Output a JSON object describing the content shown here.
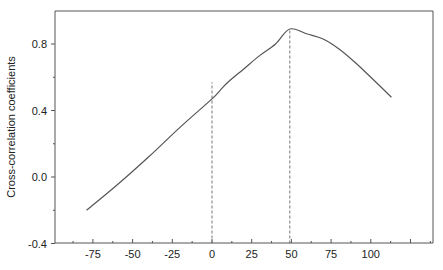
{
  "chart_data": {
    "type": "line",
    "title": "",
    "xlabel": "",
    "ylabel": "Cross-correlation coefficients",
    "xlim": [
      -100,
      140
    ],
    "ylim": [
      -0.4,
      1.0
    ],
    "x_ticks": [
      -75,
      -50,
      -25,
      0,
      25,
      50,
      75,
      100
    ],
    "x_tick_labels": [
      "-75",
      "-50",
      "-25",
      "0",
      "25",
      "50",
      "75",
      "100"
    ],
    "y_ticks": [
      -0.4,
      0.0,
      0.4,
      0.8
    ],
    "y_tick_labels": [
      "-0.4",
      "0.0",
      "0.4",
      "0.8"
    ],
    "y_minor_ticks": [
      -0.2,
      0.2,
      0.6
    ],
    "grid": false,
    "legend": null,
    "series": [
      {
        "name": "cross-correlation",
        "color": "#555555",
        "x": [
          -79,
          -60,
          -40,
          -20,
          0,
          5,
          10,
          20,
          30,
          40,
          49,
          60,
          70,
          80,
          90,
          100,
          113
        ],
        "y": [
          -0.2,
          -0.05,
          0.12,
          0.3,
          0.47,
          0.52,
          0.57,
          0.65,
          0.73,
          0.8,
          0.89,
          0.86,
          0.83,
          0.77,
          0.69,
          0.6,
          0.48
        ]
      }
    ],
    "annotations": [
      {
        "type": "vline-dashed",
        "x": 0,
        "y_from": -0.4,
        "y_to": 0.57,
        "color": "#777777"
      },
      {
        "type": "vline-dashed",
        "x": 49,
        "y_from": -0.4,
        "y_to": 0.89,
        "color": "#777777"
      }
    ]
  }
}
